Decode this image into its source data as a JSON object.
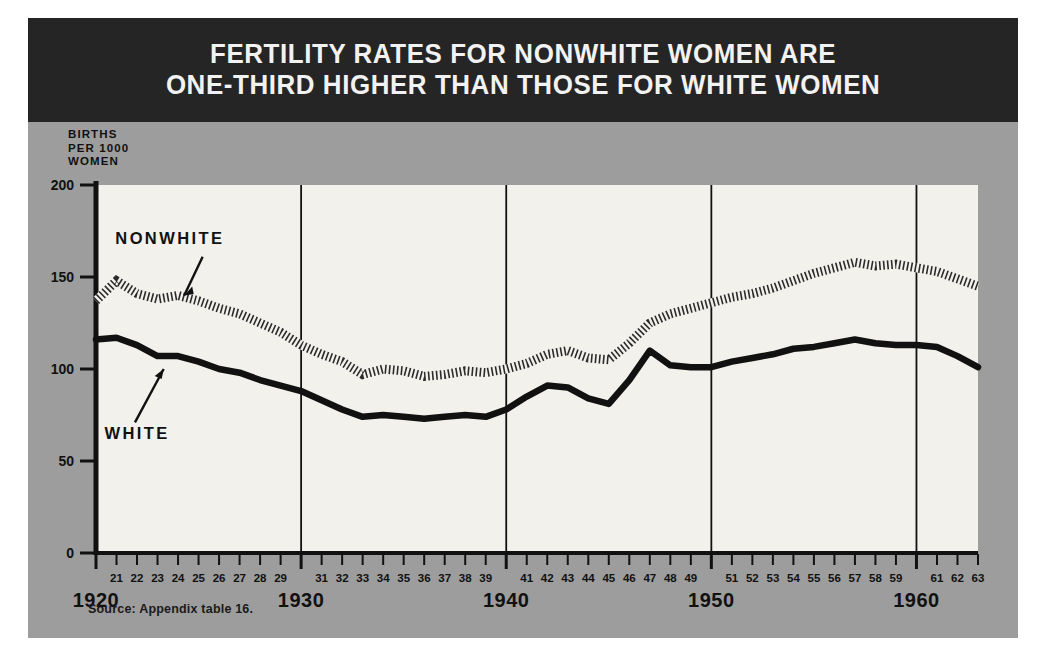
{
  "figure": {
    "title_lines": [
      "FERTILITY RATES FOR NONWHITE WOMEN ARE",
      "ONE-THIRD HIGHER THAN THOSE FOR WHITE WOMEN"
    ],
    "source_note": "Source: Appendix table 16.",
    "y_axis_caption": [
      "BIRTHS",
      "PER 1000",
      "WOMEN"
    ],
    "colors": {
      "title_band": "#252525",
      "panel": "#9d9d9d",
      "plot_background": "#f2f1ec",
      "white_series": "#111111",
      "nonwhite_series": "#333333",
      "axis": "#111111"
    }
  },
  "chart_data": {
    "type": "line",
    "title": "FERTILITY RATES FOR NONWHITE WOMEN ARE ONE-THIRD HIGHER THAN THOSE FOR WHITE WOMEN",
    "xlabel": "",
    "ylabel": "BIRTHS PER 1000 WOMEN",
    "xlim": [
      1920,
      1963
    ],
    "ylim": [
      0,
      200
    ],
    "yticks": [
      0,
      50,
      100,
      150,
      200
    ],
    "ytick_labels": [
      "0",
      "50",
      "100",
      "150",
      "200"
    ],
    "grid": false,
    "gridlines_x": [
      1930,
      1940,
      1950,
      1960
    ],
    "legend_position": "inline-annotations",
    "decade_labels": [
      "1920",
      "1930",
      "1940",
      "1950",
      "1960"
    ],
    "minor_tick_labels": [
      "21",
      "22",
      "23",
      "24",
      "25",
      "26",
      "27",
      "28",
      "29",
      "31",
      "32",
      "33",
      "34",
      "35",
      "36",
      "37",
      "38",
      "39",
      "41",
      "42",
      "43",
      "44",
      "45",
      "46",
      "47",
      "48",
      "49",
      "51",
      "52",
      "53",
      "54",
      "55",
      "56",
      "57",
      "58",
      "59",
      "61",
      "62",
      "63"
    ],
    "x": [
      1920,
      1921,
      1922,
      1923,
      1924,
      1925,
      1926,
      1927,
      1928,
      1929,
      1930,
      1931,
      1932,
      1933,
      1934,
      1935,
      1936,
      1937,
      1938,
      1939,
      1940,
      1941,
      1942,
      1943,
      1944,
      1945,
      1946,
      1947,
      1948,
      1949,
      1950,
      1951,
      1952,
      1953,
      1954,
      1955,
      1956,
      1957,
      1958,
      1959,
      1960,
      1961,
      1962,
      1963
    ],
    "series": [
      {
        "name": "NONWHITE",
        "style": "hatched",
        "values": [
          137,
          148,
          141,
          138,
          140,
          137,
          133,
          130,
          125,
          120,
          113,
          108,
          104,
          97,
          100,
          99,
          96,
          97,
          99,
          98,
          100,
          103,
          108,
          110,
          106,
          105,
          114,
          125,
          130,
          133,
          136,
          139,
          141,
          144,
          148,
          152,
          155,
          158,
          156,
          157,
          155,
          153,
          149,
          145
        ]
      },
      {
        "name": "WHITE",
        "style": "solid",
        "values": [
          116,
          117,
          113,
          107,
          107,
          104,
          100,
          98,
          94,
          91,
          88,
          83,
          78,
          74,
          75,
          74,
          73,
          74,
          75,
          74,
          78,
          85,
          91,
          90,
          84,
          81,
          94,
          110,
          102,
          101,
          101,
          104,
          106,
          108,
          111,
          112,
          114,
          116,
          114,
          113,
          113,
          112,
          107,
          101
        ]
      }
    ],
    "annotations": [
      {
        "text": "NONWHITE",
        "x": 1923.6,
        "y": 168
      },
      {
        "text": "WHITE",
        "x": 1922.0,
        "y": 62
      }
    ]
  }
}
